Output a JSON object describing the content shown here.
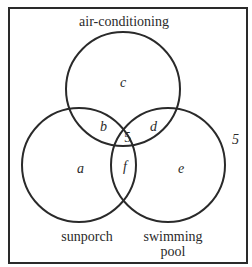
{
  "diagram": {
    "type": "venn",
    "sets": [
      {
        "name": "air-conditioning",
        "label": "air-conditioning"
      },
      {
        "name": "sunporch",
        "label": "sunporch"
      },
      {
        "name": "swimming-pool",
        "label_line1": "swimming",
        "label_line2": "pool"
      }
    ],
    "regions": {
      "a": "a",
      "b": "b",
      "c": "c",
      "d": "d",
      "e": "e",
      "f": "f",
      "center": "5",
      "outside": "5"
    },
    "colors": {
      "stroke": "#2a2a2a",
      "background": "#ffffff"
    }
  }
}
